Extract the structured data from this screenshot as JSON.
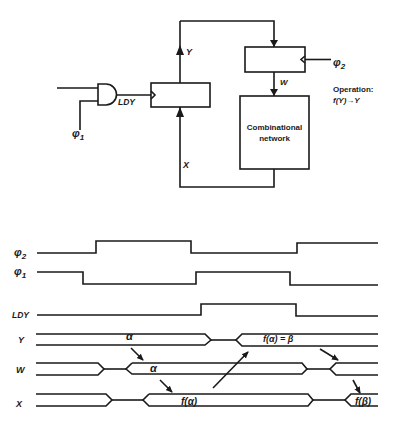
{
  "block_diagram": {
    "register_y_input_label": "X",
    "register_y_output_label": "Y",
    "register_w_output_label": "W",
    "gate_output_label": "LDY",
    "gate_clock_label": "φ",
    "gate_clock_sub": "1",
    "register_w_clock_label": "φ",
    "register_w_clock_sub": "2",
    "combinational_network_line1": "Combinational",
    "combinational_network_line2": "network",
    "operation_title": "Operation:",
    "operation_expr": "f(Y)→Y"
  },
  "timing_diagram": {
    "signals": [
      {
        "name": "φ",
        "sub": "2"
      },
      {
        "name": "φ",
        "sub": "1"
      },
      {
        "name": "LDY",
        "sub": ""
      },
      {
        "name": "Y",
        "sub": ""
      },
      {
        "name": "W",
        "sub": ""
      },
      {
        "name": "X",
        "sub": ""
      }
    ],
    "annotations": {
      "y_alpha": "α",
      "y_beta": "f(α) = β",
      "w_alpha": "α",
      "x_f_alpha": "f(α)",
      "x_f_beta": "f(β)"
    }
  }
}
